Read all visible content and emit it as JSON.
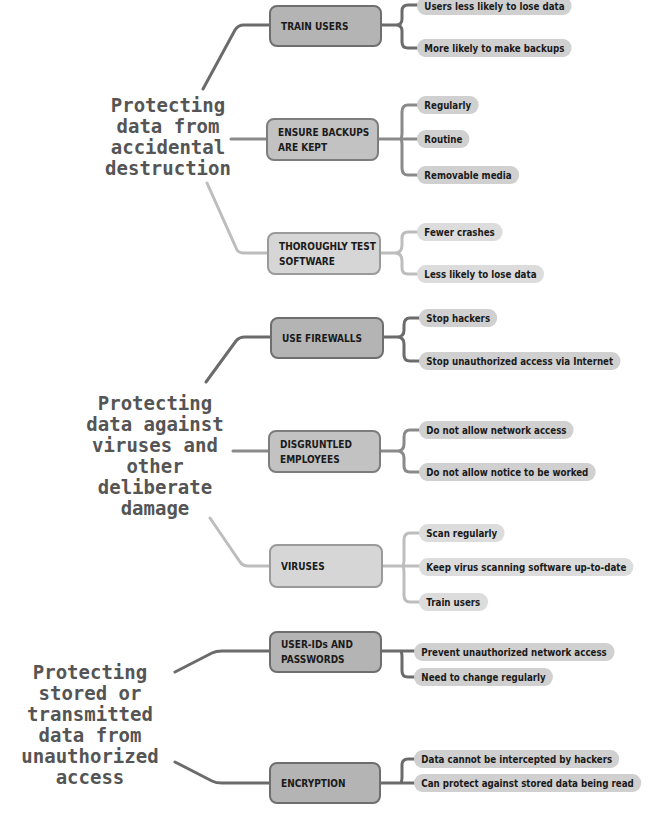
{
  "groups": [
    {
      "title": "Protecting\ndata from\naccidental\ndestruction",
      "branches": [
        {
          "label": "TRAIN USERS",
          "leaves": [
            "Users less likely to lose data",
            "More likely to make backups"
          ]
        },
        {
          "label": "ENSURE BACKUPS\nARE KEPT",
          "leaves": [
            "Regularly",
            "Routine",
            "Removable media"
          ]
        },
        {
          "label": "THOROUGHLY TEST\nSOFTWARE",
          "leaves": [
            "Fewer crashes",
            "Less likely to lose data"
          ]
        }
      ]
    },
    {
      "title": "Protecting\ndata against\nviruses and\nother\ndeliberate\ndamage",
      "branches": [
        {
          "label": "USE FIREWALLS",
          "leaves": [
            "Stop hackers",
            "Stop unauthorized access via Internet"
          ]
        },
        {
          "label": "DISGRUNTLED\nEMPLOYEES",
          "leaves": [
            "Do not allow network access",
            "Do not allow notice to be worked"
          ]
        },
        {
          "label": "VIRUSES",
          "leaves": [
            "Scan regularly",
            "Keep virus scanning software up-to-date",
            "Train users"
          ]
        }
      ]
    },
    {
      "title": "Protecting\nstored or\ntransmitted\ndata from\nunauthorized\naccess",
      "branches": [
        {
          "label": "USER-IDs AND\nPASSWORDS",
          "leaves": [
            "Prevent unauthorized network access",
            "Need to change regularly"
          ]
        },
        {
          "label": "ENCRYPTION",
          "leaves": [
            "Data cannot be intercepted by hackers",
            "Can protect against stored data being read"
          ]
        }
      ]
    }
  ],
  "colors": {
    "dark_branch": "#6b6b6b",
    "mid_branch": "#8a8a8a",
    "light_branch": "#bdbdbd",
    "node_dark": "#b4b4b4",
    "node_mid": "#c2c2c2",
    "node_light": "#d6d6d6",
    "leaf": "#d0d0d0",
    "root_text": "#555555"
  }
}
